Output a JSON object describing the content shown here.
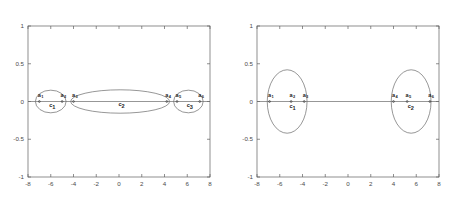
{
  "figure": {
    "background_color": "#ffffff",
    "axis_color": "#5e5e5e",
    "curve_color": "#6a6a6a",
    "text_color": "#262626"
  },
  "chart_data": [
    {
      "type": "scatter",
      "panel": "left",
      "title": "Three cluster initial partition",
      "xlabel": "",
      "ylabel": "",
      "xlim": [
        -8,
        8
      ],
      "ylim": [
        -1,
        1
      ],
      "xticks": [
        "-8",
        "-6",
        "-4",
        "-2",
        "0",
        "2",
        "4",
        "6",
        "8"
      ],
      "xtick_values": [
        -8,
        -6,
        -4,
        -2,
        0,
        2,
        4,
        6,
        8
      ],
      "yticks": [
        "1",
        "0.5",
        "0",
        "-0.5",
        "-1"
      ],
      "ytick_values": [
        1,
        0.5,
        0,
        -0.5,
        -1
      ],
      "grid": false,
      "legend": "none",
      "points": [
        {
          "label": "a",
          "sub": "1",
          "x": -7.0,
          "y": 0
        },
        {
          "label": "a",
          "sub": "2",
          "x": -5.0,
          "y": 0
        },
        {
          "label": "a",
          "sub": "3",
          "x": -4.0,
          "y": 0
        },
        {
          "label": "a",
          "sub": "4",
          "x": 4.2,
          "y": 0
        },
        {
          "label": "a",
          "sub": "5",
          "x": 5.1,
          "y": 0
        },
        {
          "label": "a",
          "sub": "6",
          "x": 7.1,
          "y": 0
        }
      ],
      "clusters": [
        {
          "label": "c",
          "sub": "1",
          "cx": -6.0,
          "cy": 0,
          "rx": 1.35,
          "ry": 0.15,
          "label_x": -6.0,
          "label_y": -0.075
        },
        {
          "label": "c",
          "sub": "2",
          "cx": 0.1,
          "cy": 0,
          "rx": 4.35,
          "ry": 0.155,
          "label_x": 0.1,
          "label_y": -0.065
        },
        {
          "label": "c",
          "sub": "3",
          "cx": 6.1,
          "cy": 0,
          "rx": 1.3,
          "ry": 0.15,
          "label_x": 6.1,
          "label_y": -0.075
        }
      ]
    },
    {
      "type": "scatter",
      "panel": "right",
      "title": "Two cluster final partition",
      "xlabel": "",
      "ylabel": "",
      "xlim": [
        -8,
        8
      ],
      "ylim": [
        -1,
        1
      ],
      "xticks": [
        "-8",
        "-6",
        "-4",
        "-2",
        "0",
        "2",
        "4",
        "6",
        "8"
      ],
      "xtick_values": [
        -8,
        -6,
        -4,
        -2,
        0,
        2,
        4,
        6,
        8
      ],
      "yticks": [
        "1",
        "0.5",
        "0",
        "-0.5",
        "-1"
      ],
      "ytick_values": [
        1,
        0.5,
        0,
        -0.5,
        -1
      ],
      "grid": false,
      "legend": "none",
      "points": [
        {
          "label": "a",
          "sub": "1",
          "x": -6.9,
          "y": 0
        },
        {
          "label": "a",
          "sub": "2",
          "x": -5.0,
          "y": 0
        },
        {
          "label": "a",
          "sub": "3",
          "x": -3.85,
          "y": 0
        },
        {
          "label": "a",
          "sub": "4",
          "x": 4.0,
          "y": 0
        },
        {
          "label": "a",
          "sub": "5",
          "x": 5.2,
          "y": 0
        },
        {
          "label": "a",
          "sub": "6",
          "x": 7.2,
          "y": 0
        }
      ],
      "clusters": [
        {
          "label": "c",
          "sub": "1",
          "cx": -5.35,
          "cy": 0,
          "rx": 1.75,
          "ry": 0.42,
          "label_x": -5.0,
          "label_y": -0.085
        },
        {
          "label": "c",
          "sub": "2",
          "cx": 5.55,
          "cy": 0,
          "rx": 1.75,
          "ry": 0.42,
          "label_x": 5.4,
          "label_y": -0.085
        }
      ]
    }
  ]
}
